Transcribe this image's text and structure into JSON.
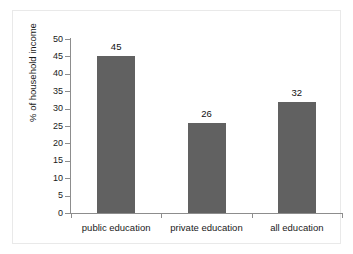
{
  "chart_data": {
    "type": "bar",
    "title": "",
    "xlabel": "",
    "ylabel": "% of household income",
    "categories": [
      "public education",
      "private education",
      "all education"
    ],
    "values": [
      45,
      26,
      32
    ],
    "value_labels": [
      "45",
      "26",
      "32"
    ],
    "ylim": [
      0,
      50
    ],
    "ytick_labels": [
      "50",
      "45",
      "40",
      "35",
      "30",
      "25",
      "20",
      "15",
      "10",
      "5",
      "0"
    ],
    "ytick_values": [
      50,
      45,
      40,
      35,
      30,
      25,
      20,
      15,
      10,
      5,
      0
    ],
    "grid": false,
    "legend": false,
    "bar_color": "#616161",
    "axis_color": "#8d8d8d",
    "frame_color": "#e9e9e9",
    "background": "#ffffff"
  }
}
